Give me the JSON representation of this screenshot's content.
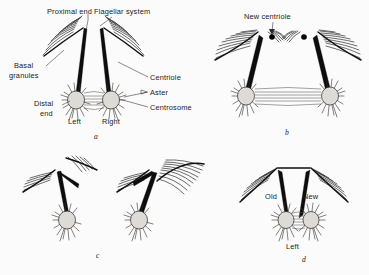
{
  "figure": {
    "background_color": "#fbfbfb",
    "ink_color": "#1a1a1a"
  },
  "panels": [
    {
      "id": "a",
      "label": "a",
      "labels": [
        {
          "name": "proximal-end",
          "text": "Proximal end"
        },
        {
          "name": "flagellar-system",
          "text": "Flagellar system"
        },
        {
          "name": "basal-granules-1",
          "text": "Basal"
        },
        {
          "name": "basal-granules-2",
          "text": "granules"
        },
        {
          "name": "distal-end-1",
          "text": "Distal"
        },
        {
          "name": "distal-end-2",
          "text": "end"
        },
        {
          "name": "centriole",
          "text": "Centriole"
        },
        {
          "name": "aster",
          "text": "Aster"
        },
        {
          "name": "centrosome",
          "text": "Centrosome"
        },
        {
          "name": "left",
          "text": "Left"
        },
        {
          "name": "right",
          "text": "Right"
        }
      ]
    },
    {
      "id": "b",
      "label": "b",
      "labels": [
        {
          "name": "new-centriole",
          "text": "New centriole"
        }
      ]
    },
    {
      "id": "c",
      "label": "c",
      "labels": []
    },
    {
      "id": "d",
      "label": "d",
      "labels": [
        {
          "name": "old",
          "text": "Old"
        },
        {
          "name": "new",
          "text": "New"
        },
        {
          "name": "left",
          "text": "Left"
        }
      ]
    }
  ],
  "text": {
    "proximal_end": "Proximal end",
    "flagellar_system": "Flagellar system",
    "basal_1": "Basal",
    "basal_2": "granules",
    "distal_1": "Distal",
    "distal_2": "end",
    "centriole": "Centriole",
    "aster": "Aster",
    "centrosome": "Centrosome",
    "left_a": "Left",
    "right_a": "Right",
    "panel_a": "a",
    "new_centriole": "New centriole",
    "panel_b": "b",
    "panel_c": "c",
    "old_d": "Old",
    "new_d": "New",
    "left_d": "Left",
    "panel_d": "d"
  }
}
